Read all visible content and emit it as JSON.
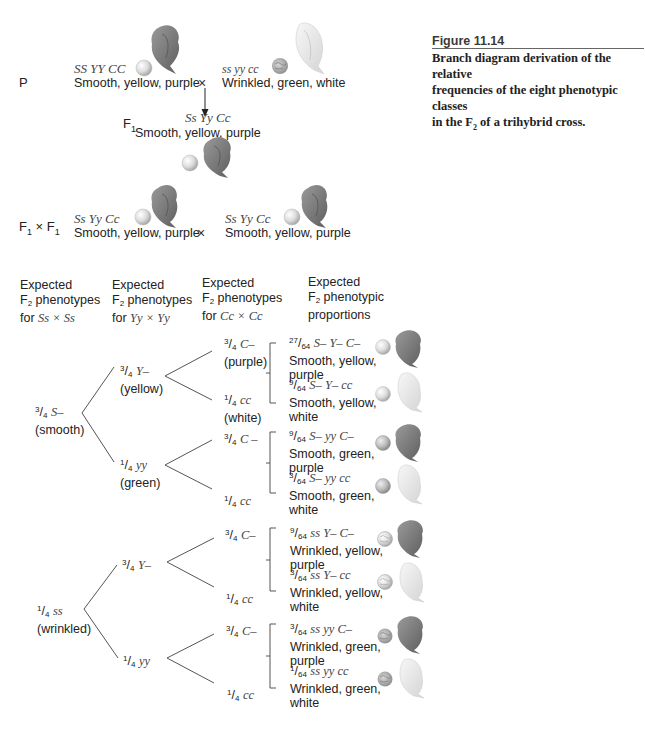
{
  "figure": {
    "number": "Figure 11.14",
    "caption_line1": "Branch diagram derivation of the relative",
    "caption_line2": "frequencies of the eight phenotypic classes",
    "caption_line3_pre": "in the F",
    "caption_line3_sub": "2",
    "caption_line3_post": " of a trihybrid cross."
  },
  "parental": {
    "label": "P",
    "cross_symbol": "×",
    "left": {
      "genotype": "SS YY CC",
      "phenotype": "Smooth, yellow, purple"
    },
    "right": {
      "genotype": "ss yy cc",
      "phenotype": "Wrinkled, green, white"
    }
  },
  "f1": {
    "label": "F",
    "label_sub": "1",
    "genotype": "Ss Yy Cc",
    "phenotype": "Smooth, yellow, purple"
  },
  "f1_cross": {
    "label_a": "F",
    "label_a_sub": "1",
    "times": " × ",
    "label_b": "F",
    "label_b_sub": "1",
    "cross_symbol": "×",
    "left": {
      "genotype": "Ss Yy Cc",
      "phenotype": "Smooth, yellow, purple"
    },
    "right": {
      "genotype": "Ss Yy Cc",
      "phenotype": "Smooth, yellow, purple"
    }
  },
  "headers": [
    {
      "line1": "Expected",
      "line2_pre": "F",
      "line2_sub": "2",
      "line2_post": " phenotypes",
      "line3_pre": "for ",
      "line3_cross": "Ss × Ss"
    },
    {
      "line1": "Expected",
      "line2_pre": "F",
      "line2_sub": "2",
      "line2_post": " phenotypes",
      "line3_pre": "for ",
      "line3_cross": "Yy × Yy"
    },
    {
      "line1": "Expected",
      "line2_pre": "F",
      "line2_sub": "2",
      "line2_post": " phenotypes",
      "line3_pre": "for ",
      "line3_cross": "Cc × Cc"
    },
    {
      "line1": "Expected",
      "line2_pre": "F",
      "line2_sub": "2",
      "line2_post": " phenotypic",
      "line3_pre": "proportions",
      "line3_cross": ""
    }
  ],
  "tree": {
    "s_branches": [
      {
        "num": "3",
        "den": "4",
        "genotype": "S–",
        "phenotype": "(smooth)"
      },
      {
        "num": "1",
        "den": "4",
        "genotype": "ss",
        "phenotype": "(wrinkled)"
      }
    ],
    "y_branches": [
      {
        "num": "3",
        "den": "4",
        "genotype": "Y–",
        "phenotype": "(yellow)"
      },
      {
        "num": "1",
        "den": "4",
        "genotype": "yy",
        "phenotype": "(green)"
      },
      {
        "num": "3",
        "den": "4",
        "genotype": "Y–",
        "phenotype": ""
      },
      {
        "num": "1",
        "den": "4",
        "genotype": "yy",
        "phenotype": ""
      }
    ],
    "c_branches": [
      {
        "num": "3",
        "den": "4",
        "genotype": "C–",
        "phenotype": "(purple)"
      },
      {
        "num": "1",
        "den": "4",
        "genotype": "cc",
        "phenotype": "(white)"
      },
      {
        "num": "3",
        "den": "4",
        "genotype": "C –",
        "phenotype": ""
      },
      {
        "num": "1",
        "den": "4",
        "genotype": "cc",
        "phenotype": ""
      },
      {
        "num": "3",
        "den": "4",
        "genotype": "C–",
        "phenotype": ""
      },
      {
        "num": "1",
        "den": "4",
        "genotype": "cc",
        "phenotype": ""
      },
      {
        "num": "3",
        "den": "4",
        "genotype": "C–",
        "phenotype": ""
      },
      {
        "num": "1",
        "den": "4",
        "genotype": "cc",
        "phenotype": ""
      }
    ],
    "proportions": [
      {
        "num": "27",
        "den": "64",
        "genotype": "S– Y– C–",
        "line1": "Smooth, yellow,",
        "line2": "purple"
      },
      {
        "num": "9",
        "den": "64",
        "genotype": "S– Y– cc",
        "line1": "Smooth, yellow,",
        "line2": "white"
      },
      {
        "num": "9",
        "den": "64",
        "genotype": "S– yy C–",
        "line1": "Smooth, green,",
        "line2": "purple"
      },
      {
        "num": "3",
        "den": "64",
        "genotype": "S– yy cc",
        "line1": "Smooth, green,",
        "line2": "white"
      },
      {
        "num": "9",
        "den": "64",
        "genotype": "ss Y– C–",
        "line1": "Wrinkled, yellow,",
        "line2": "purple"
      },
      {
        "num": "3",
        "den": "64",
        "genotype": "ss Y– cc",
        "line1": "Wrinkled, yellow,",
        "line2": "white"
      },
      {
        "num": "3",
        "den": "64",
        "genotype": "ss yy C–",
        "line1": "Wrinkled, green,",
        "line2": "purple"
      },
      {
        "num": "1",
        "den": "64",
        "genotype": "ss yy cc",
        "line1": "Wrinkled, green,",
        "line2": "white"
      }
    ]
  },
  "colors": {
    "text": "#222222",
    "genotype_text": "#444444",
    "line": "#555555",
    "smooth_seed": "#d8d8d8",
    "wrinkled_seed": "#a8a8a8",
    "purple_flower": "#7a7a7a",
    "white_flower": "#e6e6e6"
  }
}
